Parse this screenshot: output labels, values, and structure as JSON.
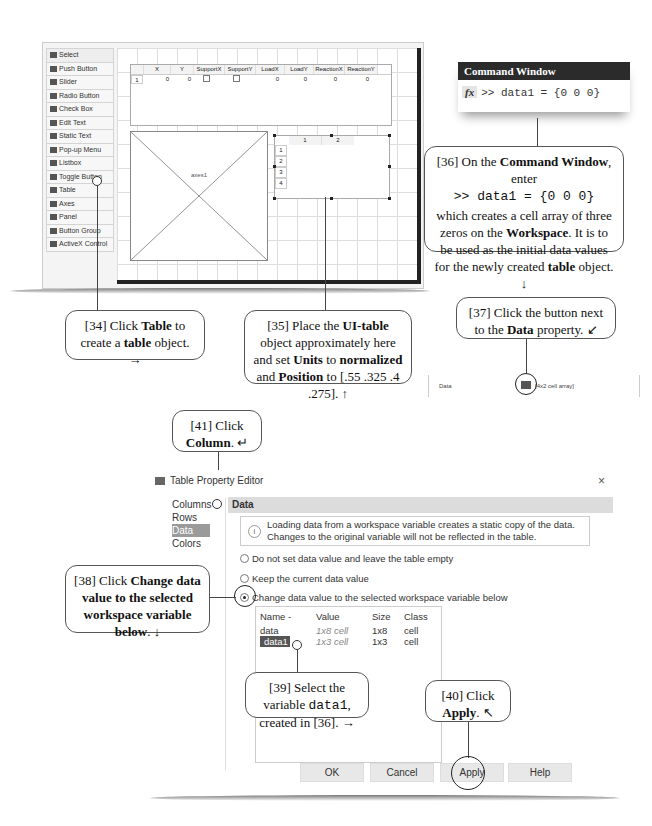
{
  "guide": {
    "palette": [
      {
        "icon": "select-arrow-icon",
        "label": "Select"
      },
      {
        "icon": "push-button-icon",
        "label": "Push Button"
      },
      {
        "icon": "slider-icon",
        "label": "Slider"
      },
      {
        "icon": "radio-button-icon",
        "label": "Radio Button"
      },
      {
        "icon": "check-box-icon",
        "label": "Check Box"
      },
      {
        "icon": "edit-text-icon",
        "label": "Edit Text"
      },
      {
        "icon": "static-text-icon",
        "label": "Static Text"
      },
      {
        "icon": "popup-menu-icon",
        "label": "Pop-up Menu"
      },
      {
        "icon": "listbox-icon",
        "label": "Listbox"
      },
      {
        "icon": "toggle-button-icon",
        "label": "Toggle Button"
      },
      {
        "icon": "table-icon",
        "label": "Table"
      },
      {
        "icon": "axes-icon",
        "label": "Axes"
      },
      {
        "icon": "panel-icon",
        "label": "Panel"
      },
      {
        "icon": "button-group-icon",
        "label": "Button Group"
      },
      {
        "icon": "activex-icon",
        "label": "ActiveX Control"
      }
    ],
    "table1": {
      "columns": [
        "X",
        "Y",
        "SupportX",
        "SupportY",
        "LoadX",
        "LoadY",
        "ReactionX",
        "ReactionY"
      ],
      "row_label": "1",
      "row_values": [
        "0",
        "0",
        "",
        "",
        "0",
        "0",
        "0",
        "0"
      ]
    },
    "axes_label": "axes1",
    "table2": {
      "columns": [
        "1",
        "2"
      ],
      "rows": [
        "1",
        "2",
        "3",
        "4"
      ]
    }
  },
  "command_window": {
    "title": "Command Window",
    "fx": "fx",
    "prompt": ">> data1 = {0 0 0}"
  },
  "data_property": {
    "label": "Data",
    "value": "[4x2  cell array]"
  },
  "callouts": {
    "c34": {
      "pre": "[34] Click ",
      "b1": "Table",
      "mid": " to create a ",
      "b2": "table",
      "post": " object. →"
    },
    "c35": {
      "pre": "[35] Place the ",
      "b1": "UI-table",
      "mid1": " object approximately here and set ",
      "b2": "Units",
      "mid2": " to ",
      "b3": "normalized",
      "mid3": " and ",
      "b4": "Position",
      "post": " to [.55 .325 .4 .275]. ↑"
    },
    "c36": {
      "pre": "[36] On the ",
      "b1": "Command Window",
      "mid": ", enter",
      "code": ">> data1 = {0 0 0}",
      "t1": "which creates a cell array of three zeros on the ",
      "b2": "Workspace",
      "t2": ". It is to be used as the initial data values for the newly created ",
      "b3": "table",
      "post": " object. ↓"
    },
    "c37": {
      "pre": "[37] Click the button next to the ",
      "b1": "Data",
      "post": " property. ↙"
    },
    "c38": {
      "pre": "[38] Click ",
      "b1": "Change data value to the selected workspace variable below",
      "post": ". ↓"
    },
    "c39": {
      "pre": "[39] Select the variable ",
      "code": "data1",
      "post": ", created in [36]. →"
    },
    "c40": {
      "pre": "[40] Click ",
      "b1": "Apply",
      "post": ". ↖"
    },
    "c41": {
      "pre": "[41] Click ",
      "b1": "Column",
      "post": ". ↵"
    }
  },
  "dialog": {
    "title": "Table Property Editor",
    "close": "×",
    "nav": [
      "Columns",
      "Rows",
      "Data",
      "Colors"
    ],
    "selected_nav": "Data",
    "section": "Data",
    "info": "Loading data from a workspace variable creates a static copy of the data. Changes to the original variable will not be reflected in the table.",
    "options": [
      {
        "label": "Do not set data value and leave the table empty",
        "checked": false
      },
      {
        "label": "Keep the current data value",
        "checked": false
      },
      {
        "label": "Change data value to the selected workspace variable below",
        "checked": true
      }
    ],
    "var_headers": [
      "Name -",
      "Value",
      "Size",
      "Class"
    ],
    "vars": [
      {
        "name": "data",
        "value": "1x8 cell",
        "size": "1x8",
        "class": "cell"
      },
      {
        "name": "data1",
        "value": "1x3 cell",
        "size": "1x3",
        "class": "cell"
      }
    ],
    "buttons": [
      "OK",
      "Cancel",
      "Apply",
      "Help"
    ]
  }
}
